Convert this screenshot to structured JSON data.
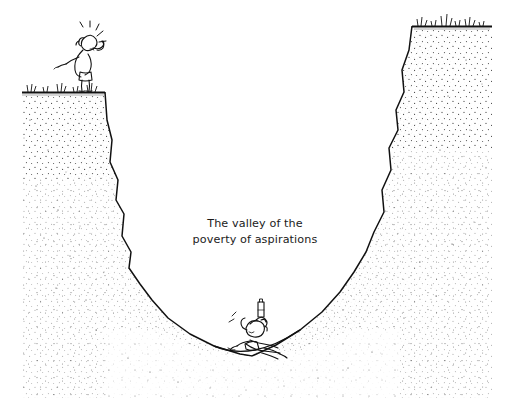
{
  "figure": {
    "kind": "pen-and-ink cartoon illustration",
    "background_color": "#ffffff",
    "ink_color": "#111111",
    "caption": {
      "line1": "The valley of the",
      "line2": "poverty of aspirations",
      "align": "center",
      "center_x": 255,
      "line1_y": 227,
      "line2_y": 243,
      "color": "#1b1b1b",
      "font_size_px": 11.2
    },
    "scene": {
      "title": "The valley of the poverty of aspirations",
      "description": "A steep stippled gorge. A person stands on the left clifftop shouting and pointing down; another person lounges at the valley floor drinking, ignoring them.",
      "terrain": {
        "left_rim": {
          "ground_start_x": 22,
          "ground_y": 92,
          "edge_x": 105
        },
        "right_rim": {
          "edge_x": 412,
          "ground_y": 26,
          "ground_end_x": 492
        },
        "valley_floor_y": 356,
        "valley_floor_center_x": 252,
        "stipple": "dense near outline, fading into interior"
      },
      "characters": [
        {
          "id": "shouter",
          "label": "person shouting from the clifftop",
          "position": {
            "x": 82,
            "y": 58
          },
          "pose": "leaning forward, one arm pointing down into the valley, one hand cupped at the mouth",
          "accessories": [
            "sound-burst lines"
          ]
        },
        {
          "id": "lounger",
          "label": "person lounging at the bottom of the valley",
          "position": {
            "x": 247,
            "y": 338
          },
          "pose": "reclining on the valley floor, hand raised near the head",
          "accessories": [
            "bottle",
            "motion marks"
          ]
        }
      ],
      "vegetation": [
        {
          "id": "grass-left-rim",
          "x": 30,
          "y": 90
        },
        {
          "id": "grass-left-rim-2",
          "x": 60,
          "y": 90
        },
        {
          "id": "grass-left-rim-3",
          "x": 92,
          "y": 90
        },
        {
          "id": "grass-right-rim",
          "x": 420,
          "y": 24
        },
        {
          "id": "grass-right-rim-2",
          "x": 445,
          "y": 22
        },
        {
          "id": "grass-right-rim-3",
          "x": 470,
          "y": 25
        }
      ]
    }
  }
}
